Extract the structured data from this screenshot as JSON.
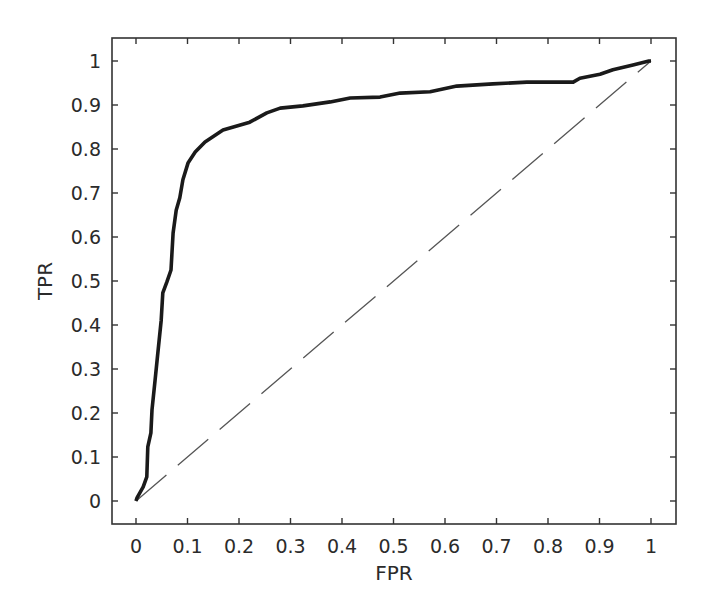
{
  "chart_data": {
    "type": "line",
    "title": "",
    "xlabel": "FPR",
    "ylabel": "TPR",
    "xlim": [
      0,
      1
    ],
    "ylim": [
      0,
      1
    ],
    "grid": false,
    "legend": null,
    "x_ticks": [
      "0",
      "0.1",
      "0.2",
      "0.3",
      "0.4",
      "0.5",
      "0.6",
      "0.7",
      "0.8",
      "0.9",
      "1"
    ],
    "y_ticks": [
      "0",
      "0.1",
      "0.2",
      "0.3",
      "0.4",
      "0.5",
      "0.6",
      "0.7",
      "0.8",
      "0.9",
      "1"
    ],
    "series": [
      {
        "name": "ROC curve",
        "style": "solid",
        "color": "#1a1a1a",
        "x": [
          0,
          0.002,
          0.014,
          0.021,
          0.023,
          0.029,
          0.031,
          0.037,
          0.041,
          0.049,
          0.052,
          0.06,
          0.068,
          0.072,
          0.078,
          0.085,
          0.091,
          0.101,
          0.115,
          0.134,
          0.169,
          0.221,
          0.254,
          0.28,
          0.324,
          0.377,
          0.416,
          0.474,
          0.513,
          0.571,
          0.623,
          0.693,
          0.759,
          0.849,
          0.862,
          0.901,
          0.926,
          0.965,
          0.996,
          1
        ],
        "y": [
          0,
          0.007,
          0.032,
          0.055,
          0.123,
          0.155,
          0.207,
          0.275,
          0.32,
          0.411,
          0.473,
          0.498,
          0.525,
          0.609,
          0.661,
          0.689,
          0.73,
          0.768,
          0.793,
          0.816,
          0.843,
          0.861,
          0.882,
          0.893,
          0.898,
          0.907,
          0.916,
          0.918,
          0.927,
          0.93,
          0.943,
          0.948,
          0.952,
          0.952,
          0.961,
          0.97,
          0.98,
          0.991,
          1.0,
          1.0
        ]
      },
      {
        "name": "Random classifier",
        "style": "dashed",
        "color": "#555555",
        "x": [
          0,
          1
        ],
        "y": [
          0,
          1
        ]
      }
    ]
  }
}
